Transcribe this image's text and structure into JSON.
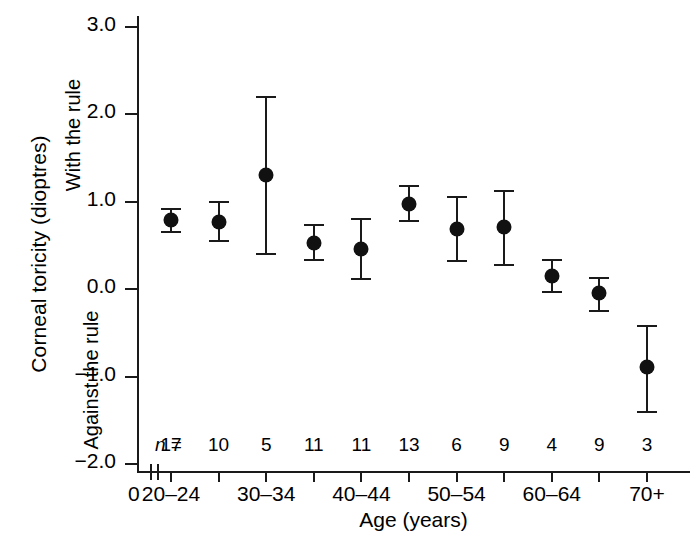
{
  "chart_data": {
    "type": "scatter",
    "title": "",
    "xlabel": "Age (years)",
    "ylabel": "Corneal toricity (dioptres)",
    "ylim": [
      -2.0,
      3.0
    ],
    "yticks": [
      3.0,
      2.0,
      1.0,
      0.0,
      -1.0,
      -2.0
    ],
    "ytick_labels": [
      "3.0",
      "2.0",
      "1.0",
      "0.0",
      "-1.0",
      "-2.0"
    ],
    "grid": false,
    "legend": "none",
    "axis_break": true,
    "x_origin_label": "0",
    "direction_labels": {
      "positive": "With the rule",
      "negative": "Against the rule"
    },
    "n_prefix": "n =",
    "categories": [
      "20-24",
      "25-29",
      "30-34",
      "35-39",
      "40-44",
      "45-49",
      "50-54",
      "55-59",
      "60-64",
      "65-69",
      "70+"
    ],
    "xtick_labels": [
      "20–24",
      "",
      "30–34",
      "",
      "40–44",
      "",
      "50–54",
      "",
      "60–64",
      "",
      "70+"
    ],
    "values": [
      0.78,
      0.75,
      1.29,
      0.52,
      0.45,
      0.96,
      0.67,
      0.7,
      0.14,
      -0.06,
      -0.9
    ],
    "err_low": [
      0.65,
      0.55,
      0.4,
      0.33,
      0.11,
      0.78,
      0.32,
      0.27,
      -0.03,
      -0.25,
      -1.4
    ],
    "err_high": [
      0.92,
      1.0,
      2.2,
      0.73,
      0.8,
      1.18,
      1.05,
      1.12,
      0.33,
      0.13,
      -0.42
    ],
    "n": [
      17,
      10,
      5,
      11,
      11,
      13,
      6,
      9,
      4,
      9,
      3
    ],
    "marker_color": "#111111",
    "axis_color": "#1a1a1a"
  }
}
